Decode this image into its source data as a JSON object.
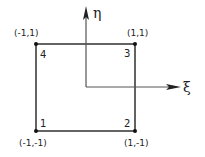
{
  "diagram": {
    "title": "",
    "axes": {
      "horizontal": {
        "label": "ξ",
        "name": "xi"
      },
      "vertical": {
        "label": "η",
        "name": "eta"
      }
    },
    "nodes": [
      {
        "id": "1",
        "number": "1",
        "coords": "(-1,-1)",
        "xi": -1,
        "eta": -1
      },
      {
        "id": "2",
        "number": "2",
        "coords": "(1,-1)",
        "xi": 1,
        "eta": -1
      },
      {
        "id": "3",
        "number": "3",
        "coords": "(1,1)",
        "xi": 1,
        "eta": 1
      },
      {
        "id": "4",
        "number": "4",
        "coords": "(-1,1)",
        "xi": -1,
        "eta": 1
      }
    ],
    "colors": {
      "stroke": "#222222",
      "background": "#ffffff"
    }
  }
}
